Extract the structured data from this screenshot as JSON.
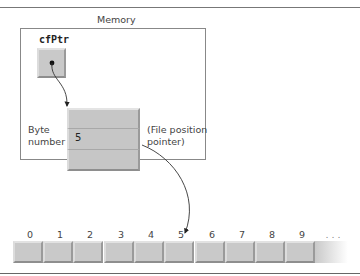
{
  "diagram": {
    "title": "Memory",
    "pointer_variable": "cfPtr",
    "byte_number_label": [
      "Byte",
      "number"
    ],
    "byte_number_value": "5",
    "file_position_label": [
      "(File position",
      "pointer)"
    ],
    "file_bytes": {
      "indices": [
        "0",
        "1",
        "2",
        "3",
        "4",
        "5",
        "6",
        "7",
        "8",
        "9",
        ". . ."
      ],
      "pointed_index": "5"
    }
  },
  "colors": {
    "cell_fill": "#c9c9c9",
    "border": "#888888",
    "text": "#444444"
  }
}
